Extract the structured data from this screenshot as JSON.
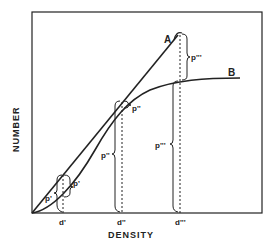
{
  "figure": {
    "type": "line diagram",
    "xlabel": "DENSITY",
    "ylabel": "NUMBER",
    "curves": [
      {
        "name": "A",
        "label": "A",
        "shape": "straight line from origin"
      },
      {
        "name": "B",
        "label": "B",
        "shape": "S-shaped curve rising then leveling off"
      }
    ],
    "x_markers": [
      {
        "label": "d'"
      },
      {
        "label": "d''"
      },
      {
        "label": "d'''"
      }
    ],
    "brace_labels": {
      "p1_a": "p'",
      "p1_b": "p'",
      "p2_a": "p''",
      "p2_b": "p''",
      "p3_a": "p'''",
      "p3_b": "p'''"
    }
  },
  "colors": {
    "ink": "#222222",
    "background": "#ffffff"
  }
}
